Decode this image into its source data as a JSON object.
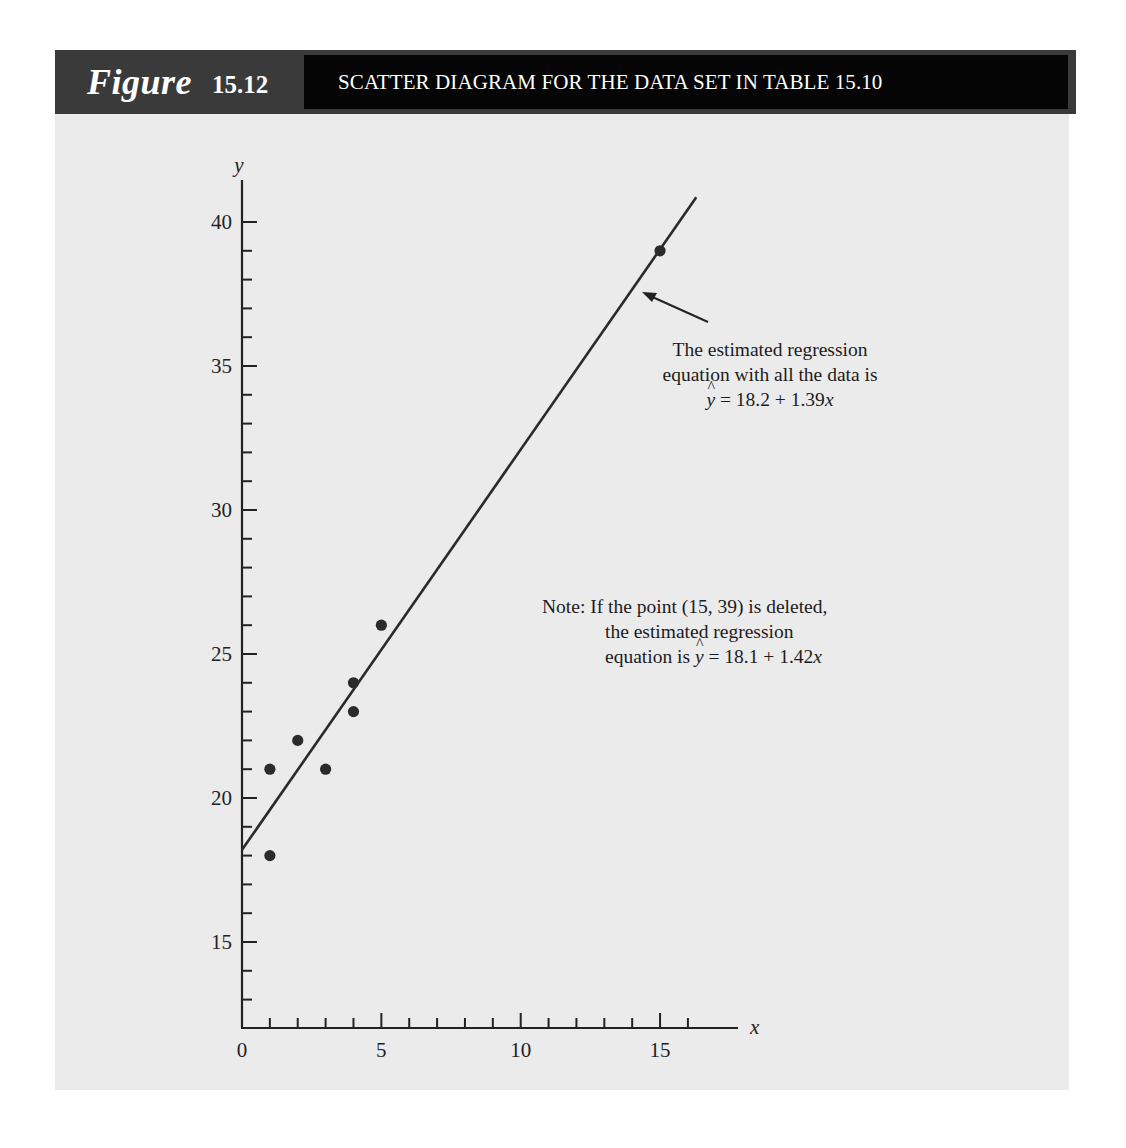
{
  "figure": {
    "label_word": "Figure",
    "label_number": "15.12",
    "title": "SCATTER DIAGRAM FOR THE DATA SET IN TABLE 15.10"
  },
  "colors": {
    "header_left": "#3a3a3a",
    "header_title_bg": "#050505",
    "panel_bg": "#ebebeb",
    "ink": "#222222"
  },
  "annotations": {
    "full_fit": {
      "line1": "The estimated regression",
      "line2": "equation with all the data is",
      "eq_lhs": "y",
      "eq_rhs": "= 18.2 + 1.39",
      "eq_var": "x"
    },
    "note": {
      "prefix": "Note:",
      "line1": "If the point (15, 39) is deleted,",
      "line2": "the estimated regression",
      "line3_prefix": "equation is",
      "eq_lhs": "y",
      "eq_rhs": "= 18.1 + 1.42",
      "eq_var": "x"
    }
  },
  "chart_data": {
    "type": "scatter",
    "title": "SCATTER DIAGRAM FOR THE DATA SET IN TABLE 15.10",
    "xlabel": "x",
    "ylabel": "y",
    "xlim": [
      0,
      18
    ],
    "ylim": [
      12,
      41.5
    ],
    "x_ticks": [
      0,
      5,
      10,
      15
    ],
    "x_minor_step": 1,
    "y_ticks": [
      15,
      20,
      25,
      30,
      35,
      40
    ],
    "y_minor_step": 1,
    "grid": false,
    "points": [
      {
        "x": 1,
        "y": 18
      },
      {
        "x": 1,
        "y": 21
      },
      {
        "x": 2,
        "y": 22
      },
      {
        "x": 3,
        "y": 21
      },
      {
        "x": 4,
        "y": 23
      },
      {
        "x": 4,
        "y": 24
      },
      {
        "x": 5,
        "y": 26
      },
      {
        "x": 15,
        "y": 39
      }
    ],
    "regression_line": {
      "label": "The estimated regression equation with all the data is ŷ = 18.2 + 1.39x",
      "intercept": 18.2,
      "slope": 1.39,
      "x_range": [
        0,
        16.3
      ]
    },
    "alt_regression": {
      "label": "If the point (15, 39) is deleted, the estimated regression equation is ŷ = 18.1 + 1.42x",
      "intercept": 18.1,
      "slope": 1.42
    }
  }
}
